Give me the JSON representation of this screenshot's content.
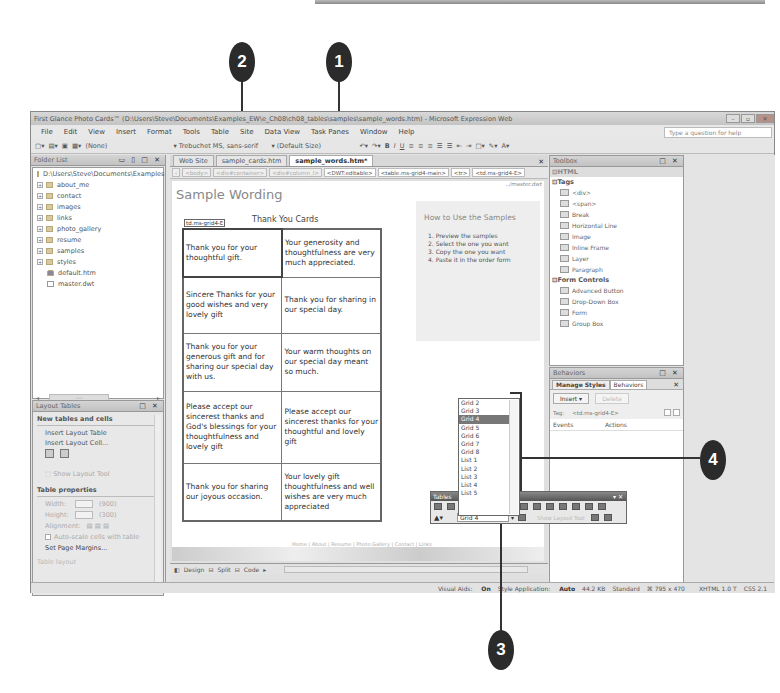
{
  "callouts": [
    {
      "number": "1"
    },
    {
      "number": "2"
    },
    {
      "number": "3"
    },
    {
      "number": "4"
    }
  ],
  "window": {
    "title": "First Glance Photo Cards™ (D:\\Users\\Steve\\Documents\\Examples_EW\\e_Ch08\\ch08_tables\\samples\\sample_words.htm) - Microsoft Expression Web",
    "controls": {
      "minimize": "–",
      "maximize": "▫",
      "close": "✕"
    }
  },
  "menu": {
    "items": [
      "File",
      "Edit",
      "View",
      "Insert",
      "Format",
      "Tools",
      "Table",
      "Site",
      "Data View",
      "Task Panes",
      "Window",
      "Help"
    ],
    "help_placeholder": "Type a question for help"
  },
  "toolbar": {
    "style": "(None)",
    "font": "Trebuchet MS, sans-serif",
    "size": "(Default Size)",
    "format_buttons": [
      "B",
      "I",
      "U"
    ]
  },
  "folder_list": {
    "title": "Folder List",
    "root": "D:\\Users\\Steve\\Documents\\Examples",
    "items": [
      {
        "name": "about_me",
        "type": "folder"
      },
      {
        "name": "contact",
        "type": "folder"
      },
      {
        "name": "images",
        "type": "folder"
      },
      {
        "name": "links",
        "type": "folder"
      },
      {
        "name": "photo_gallery",
        "type": "folder"
      },
      {
        "name": "resume",
        "type": "folder"
      },
      {
        "name": "samples",
        "type": "folder"
      },
      {
        "name": "styles",
        "type": "folder"
      },
      {
        "name": "default.htm",
        "type": "home"
      },
      {
        "name": "master.dwt",
        "type": "file"
      }
    ]
  },
  "layout_tables": {
    "title": "Layout Tables",
    "section1": "New tables and cells",
    "insert_table": "Insert Layout Table",
    "insert_cell": "Insert Layout Cell...",
    "show_tool": "Show Layout Tool",
    "section2": "Table properties",
    "width_label": "Width:",
    "width_value": "(900)",
    "height_label": "Height:",
    "height_value": "(300)",
    "alignment_label": "Alignment:",
    "autoscale": "Auto-scale cells with table",
    "page_margins": "Set Page Margins...",
    "section3": "Table layout"
  },
  "editor": {
    "tabs": [
      "Web Site",
      "sample_cards.htm",
      "sample_words.htm*"
    ],
    "active_tab": 2,
    "quick_tags": [
      "<body>",
      "<div#container>",
      "<div#column_l>",
      "<DWT:editable>",
      "<table.ms-grid4-main>",
      "<tr>",
      "<td.ms-grid4-E>"
    ],
    "master_label": "../master.dwt",
    "page_heading": "Sample Wording",
    "table_title": "Thank You Cards",
    "cell_tag_label": "td.ms-grid4-E",
    "rows": [
      [
        "Thank you for your thoughtful gift.",
        "Your generosity and thoughtfulness are very much appreciated."
      ],
      [
        "Sincere Thanks for your good wishes and very lovely gift",
        "Thank you for sharing in our special day."
      ],
      [
        "Thank you for your generous gift and for sharing our special day with us.",
        "Your warm thoughts on our special day meant so much."
      ],
      [
        "Please accept our sincerest thanks and God's blessings for your thoughtfulness and lovely gift",
        "Please accept our sincerest thanks for your thoughtful and lovely gift"
      ],
      [
        "Thank you for sharing our joyous occasion.",
        "Your lovely gift thoughtfulness and well wishes are very much appreciated"
      ]
    ],
    "howto": {
      "heading": "How to Use the Samples",
      "steps": [
        "1.   Preview the samples",
        "2.   Select the one you want",
        "3.   Copy the one you want",
        "4.   Paste it in the order form"
      ]
    },
    "footer_links": "Home | About | Resume | Photo Gallery | Contact | Links",
    "views": {
      "design": "Design",
      "split": "Split",
      "code": "Code"
    }
  },
  "toolbox": {
    "title": "Toolbox",
    "html_section": "HTML",
    "tags_section": "Tags",
    "tags": [
      "<div>",
      "<span>",
      "Break",
      "Horizontal Line",
      "Image",
      "Inline Frame",
      "Layer",
      "Paragraph"
    ],
    "form_section": "Form Controls",
    "form_items": [
      "Advanced Button",
      "Drop-Down Box",
      "Form",
      "Group Box"
    ]
  },
  "behaviors": {
    "title": "Behaviors",
    "tabs": [
      "Manage Styles",
      "Behaviors"
    ],
    "insert_label": "Insert ▾",
    "delete_label": "Delete",
    "tag_label": "Tag:",
    "tag_value": "<td.ms-grid4-E>",
    "col_events": "Events",
    "col_actions": "Actions"
  },
  "tables_toolbar": {
    "title": "Tables",
    "selected_style": "Grid 4",
    "show_layout_tool": "Show Layout Tool",
    "style_options": [
      "Grid 2",
      "Grid 3",
      "Grid 4",
      "Grid 5",
      "Grid 6",
      "Grid 7",
      "Grid 8",
      "List 1",
      "List 2",
      "List 3",
      "List 4",
      "List 5"
    ],
    "selected_index": 2
  },
  "statusbar": {
    "visual_aids_label": "Visual Aids:",
    "visual_aids_value": "On",
    "style_app_label": "Style Application:",
    "style_app_value": "Auto",
    "file_size": "44.2 KB",
    "mode": "Standard",
    "dimensions": "795 x 470",
    "doctype": "XHTML 1.0 T",
    "css": "CSS 2.1"
  }
}
